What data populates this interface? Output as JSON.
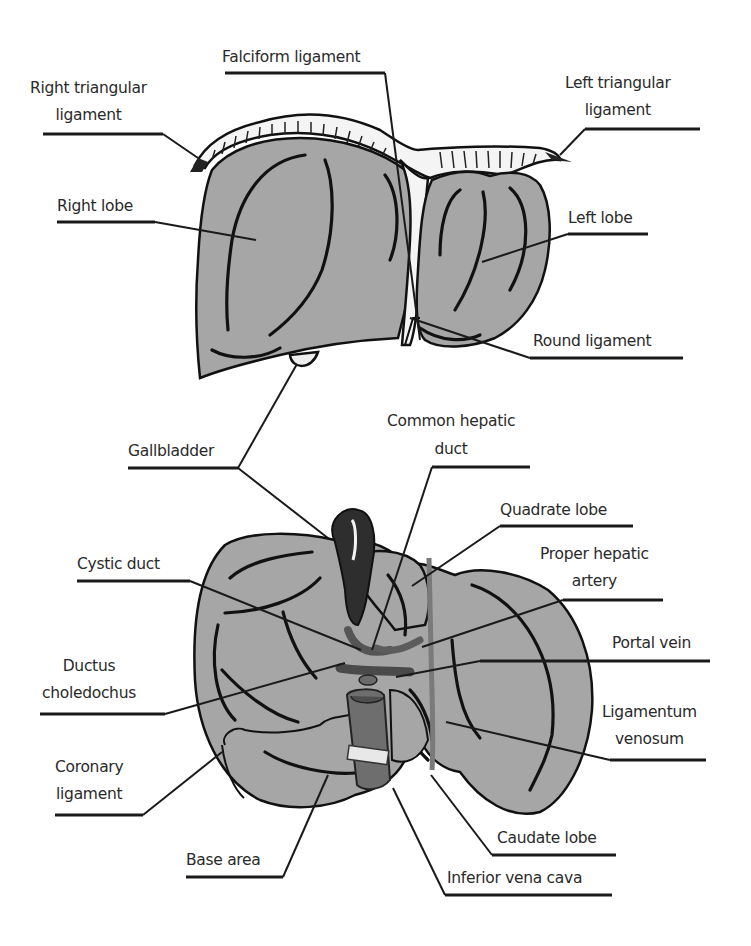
{
  "figure": {
    "colors": {
      "liver_fill": "#a6a6a6",
      "outline": "#111111",
      "gallbladder": "#333333",
      "vessel": "#6e6e6e",
      "background": "#ffffff"
    }
  },
  "anterior_view": {
    "labels": [
      {
        "id": "falciform",
        "lines": [
          "Falciform ligament"
        ]
      },
      {
        "id": "right_triangular",
        "lines": [
          "Right triangular",
          "ligament"
        ]
      },
      {
        "id": "left_triangular",
        "lines": [
          "Left triangular",
          "ligament"
        ]
      },
      {
        "id": "right_lobe",
        "lines": [
          "Right lobe"
        ]
      },
      {
        "id": "left_lobe",
        "lines": [
          "Left lobe"
        ]
      },
      {
        "id": "round_ligament",
        "lines": [
          "Round ligament"
        ]
      }
    ]
  },
  "shared": {
    "labels": [
      {
        "id": "gallbladder",
        "lines": [
          "Gallbladder"
        ]
      }
    ]
  },
  "visceral_view": {
    "labels": [
      {
        "id": "common_hepatic_duct",
        "lines": [
          "Common hepatic",
          "duct"
        ]
      },
      {
        "id": "quadrate_lobe",
        "lines": [
          "Quadrate lobe"
        ]
      },
      {
        "id": "cystic_duct",
        "lines": [
          "Cystic duct"
        ]
      },
      {
        "id": "proper_hepatic_artery",
        "lines": [
          "Proper hepatic",
          "artery"
        ]
      },
      {
        "id": "portal_vein",
        "lines": [
          "Portal vein"
        ]
      },
      {
        "id": "ductus_choledochus",
        "lines": [
          "Ductus",
          "choledochus"
        ]
      },
      {
        "id": "ligamentum_venosum",
        "lines": [
          "Ligamentum",
          "venosum"
        ]
      },
      {
        "id": "coronary_ligament",
        "lines": [
          "Coronary",
          "ligament"
        ]
      },
      {
        "id": "caudate_lobe",
        "lines": [
          "Caudate lobe"
        ]
      },
      {
        "id": "base_area",
        "lines": [
          "Base area"
        ]
      },
      {
        "id": "inferior_vena_cava",
        "lines": [
          "Inferior vena cava"
        ]
      }
    ]
  }
}
